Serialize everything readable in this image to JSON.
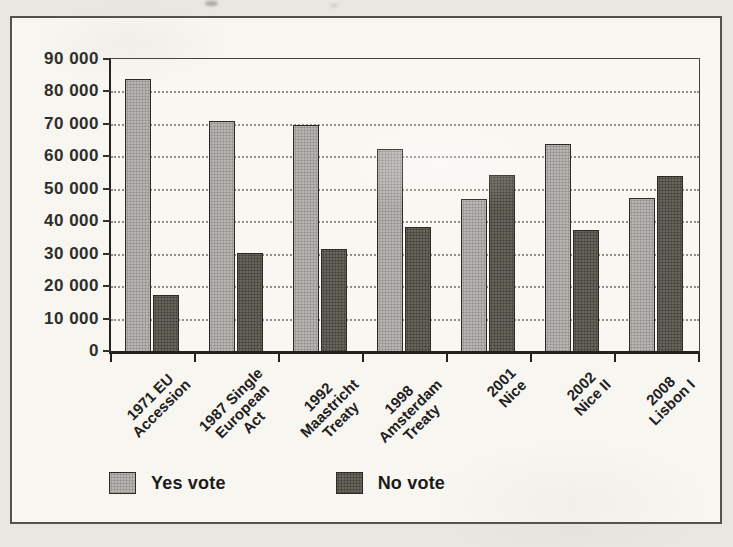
{
  "figure": {
    "page_background": "#e9e7e2",
    "frame_background": "#f8f6f1",
    "frame_border_color": "#55524c"
  },
  "legend": {
    "yes_label": "Yes vote",
    "no_label": "No vote"
  },
  "chart_data": {
    "type": "bar",
    "title": "",
    "xlabel": "",
    "ylabel": "",
    "categories": [
      [
        "1971 EU",
        "Accession"
      ],
      [
        "1987 Single",
        "European",
        "Act"
      ],
      [
        "1992",
        "Maastricht",
        "Treaty"
      ],
      [
        "1998",
        "Amsterdam",
        "Treaty"
      ],
      [
        "2001",
        "Nice"
      ],
      [
        "2002",
        "Nice II"
      ],
      [
        "2008",
        "Lisbon I"
      ]
    ],
    "series": [
      {
        "name": "Yes vote",
        "color": "#b7b5b1",
        "values": [
          83500,
          70500,
          69500,
          62000,
          46500,
          63500,
          47000
        ]
      },
      {
        "name": "No vote",
        "color": "#676459",
        "values": [
          17000,
          30000,
          31000,
          38000,
          54000,
          37000,
          53500
        ]
      }
    ],
    "ylim": [
      0,
      90000
    ],
    "ytick_interval": 10000,
    "ytick_labels": [
      "0",
      "10 000",
      "20 000",
      "30 000",
      "40 000",
      "50 000",
      "60 000",
      "70 000",
      "80 000",
      "90 000"
    ],
    "grid": "horizontal-dotted",
    "legend_position": "bottom-left"
  }
}
